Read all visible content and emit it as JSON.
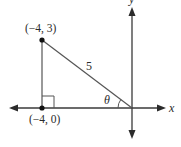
{
  "diagram": {
    "type": "coordinate-plane-right-triangle",
    "axes": {
      "x_label": "x",
      "y_label": "y"
    },
    "points": [
      {
        "name": "top-vertex",
        "label": "(−4, 3)",
        "x": -4,
        "y": 3
      },
      {
        "name": "bottom-vertex",
        "label": "(−4, 0)",
        "x": -4,
        "y": 0
      }
    ],
    "hypotenuse_label": "5",
    "angle_label": "θ",
    "right_angle_at": "(−4, 0)",
    "colors": {
      "line": "#555555",
      "axis": "#3a3a3a",
      "point": "#111111",
      "text": "#2b2b2b",
      "background": "#ffffff"
    }
  }
}
